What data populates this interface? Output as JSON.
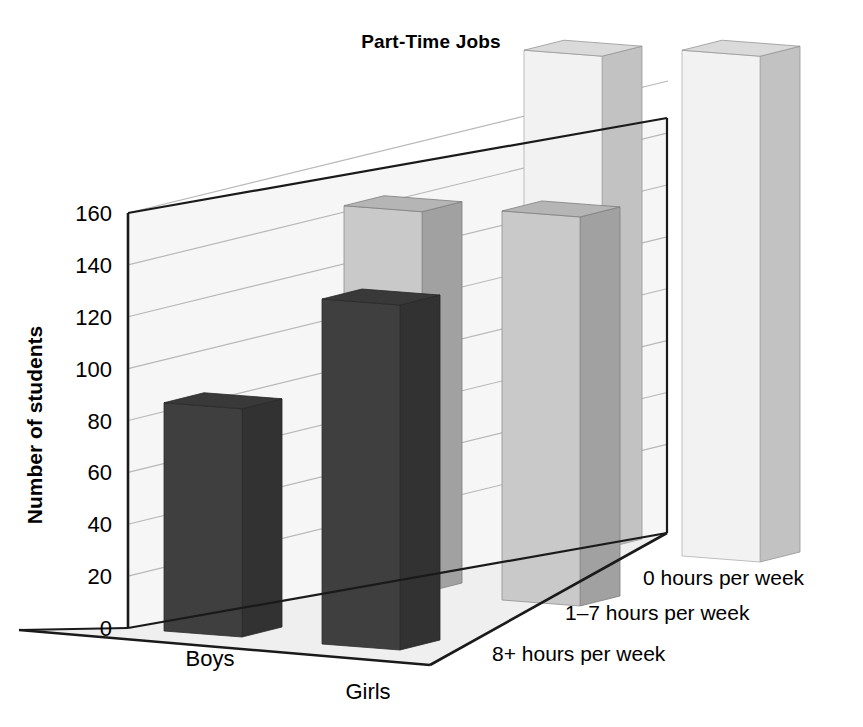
{
  "chart_data": {
    "type": "bar",
    "subtype": "3d-grouped-bar",
    "title": "Part-Time Jobs",
    "xlabel": "",
    "ylabel": "Number of students",
    "zlabel": "",
    "categories": [
      "Boys",
      "Girls"
    ],
    "series": [
      {
        "name": "8+ hours per week",
        "values": [
          88,
          133
        ],
        "color": "#3f3f3f"
      },
      {
        "name": "1–7 hours per week",
        "values": [
          147,
          150
        ],
        "color": "#c9c9c9"
      },
      {
        "name": "0 hours per week",
        "values": [
          190,
          195
        ],
        "color": "#f2f2f2"
      }
    ],
    "ylim": [
      0,
      160
    ],
    "ytick_step": 20,
    "yticks": [
      "0",
      "20",
      "40",
      "60",
      "80",
      "100",
      "120",
      "140",
      "160"
    ],
    "grid": true,
    "grid_axis": "y",
    "legend": "none"
  },
  "axes": {
    "y_title": "Number of students",
    "y_ticks": [
      "0",
      "20",
      "40",
      "60",
      "80",
      "100",
      "120",
      "140",
      "160"
    ],
    "x_categories": [
      "Boys",
      "Girls"
    ],
    "depth_categories": [
      "0 hours per week",
      "1–7 hours per week",
      "8+ hours per week"
    ]
  },
  "title": "Part-Time Jobs",
  "colors": {
    "background": "#ffffff",
    "axis_line": "#1a1a1a",
    "grid_line": "#b8b8b8",
    "wall": "#f4f4f4",
    "floor": "#efefef",
    "bar_dark_front": "#3f3f3f",
    "bar_dark_side": "#2b2b2b",
    "bar_dark_top": "#343434",
    "bar_mid_front": "#c9c9c9",
    "bar_mid_side": "#b0b0b0",
    "bar_mid_top": "#bfbfbf",
    "bar_light_front": "#f3f3f3",
    "bar_light_side": "#e4e4e4",
    "bar_light_top": "#dedede",
    "text": "#1a1a1a"
  }
}
